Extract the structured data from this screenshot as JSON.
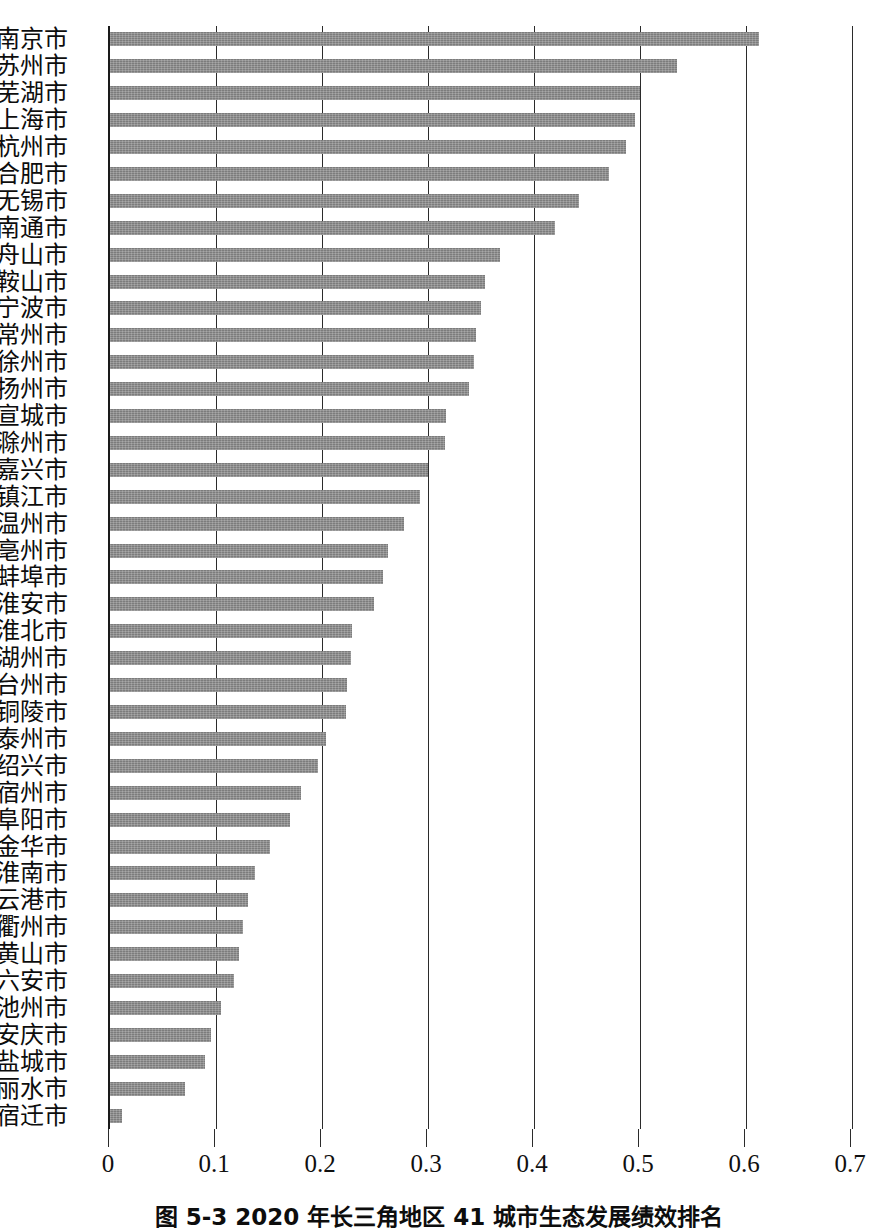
{
  "chart_data": {
    "type": "bar",
    "orientation": "horizontal",
    "title": "",
    "xlabel": "",
    "ylabel": "",
    "xlim": [
      0,
      0.7
    ],
    "xticks": [
      "0",
      "0.1",
      "0.2",
      "0.3",
      "0.4",
      "0.5",
      "0.6",
      "0.7"
    ],
    "xtick_values": [
      0,
      0.1,
      0.2,
      0.3,
      0.4,
      0.5,
      0.6,
      0.7
    ],
    "grid": "vertical",
    "legend": "none",
    "bar_color": "#7c7c7c",
    "categories": [
      "南京市",
      "苏州市",
      "芜湖市",
      "上海市",
      "杭州市",
      "合肥市",
      "无锡市",
      "南通市",
      "舟山市",
      "马鞍山市",
      "宁波市",
      "常州市",
      "徐州市",
      "扬州市",
      "宣城市",
      "滁州市",
      "嘉兴市",
      "镇江市",
      "温州市",
      "亳州市",
      "蚌埠市",
      "淮安市",
      "淮北市",
      "湖州市",
      "台州市",
      "铜陵市",
      "泰州市",
      "绍兴市",
      "宿州市",
      "阜阳市",
      "金华市",
      "淮南市",
      "连云港市",
      "衢州市",
      "黄山市",
      "六安市",
      "池州市",
      "安庆市",
      "盐城市",
      "丽水市",
      "宿迁市"
    ],
    "values": [
      0.612,
      0.535,
      0.5,
      0.495,
      0.487,
      0.471,
      0.442,
      0.42,
      0.368,
      0.354,
      0.35,
      0.345,
      0.343,
      0.339,
      0.317,
      0.316,
      0.3,
      0.292,
      0.277,
      0.262,
      0.258,
      0.249,
      0.228,
      0.227,
      0.224,
      0.223,
      0.204,
      0.196,
      0.18,
      0.17,
      0.151,
      0.137,
      0.13,
      0.125,
      0.122,
      0.117,
      0.105,
      0.095,
      0.09,
      0.071,
      0.011
    ]
  },
  "caption": {
    "text": "图 5-3  2020 年长三角地区 41 城市生态发展绩效排名"
  }
}
